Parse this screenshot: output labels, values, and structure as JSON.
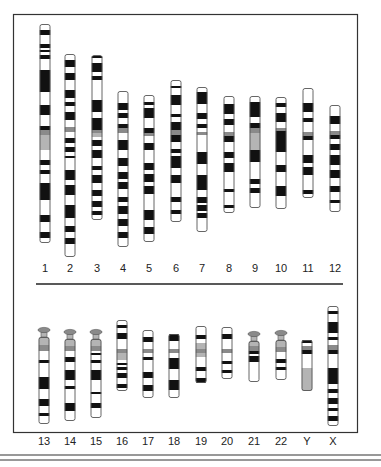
{
  "figure": {
    "type": "karyotype-ideogram",
    "colors": {
      "dark": "#111111",
      "grey": "#8a8a8a",
      "light_grey": "#b4b4b4",
      "outline": "#555555",
      "light": "#ffffff"
    },
    "row1": [
      {
        "label": "1",
        "x": 45,
        "top": 24,
        "bottom": 243,
        "bands": [
          [
            30,
            35,
            "d"
          ],
          [
            44,
            48,
            "d"
          ],
          [
            50,
            52,
            "d"
          ],
          [
            55,
            59,
            "d"
          ],
          [
            70,
            92,
            "d"
          ],
          [
            105,
            115,
            "d"
          ],
          [
            126,
            130,
            "d"
          ],
          [
            130,
            135,
            "g"
          ],
          [
            135,
            150,
            "l"
          ],
          [
            160,
            165,
            "d"
          ],
          [
            170,
            174,
            "d"
          ],
          [
            183,
            200,
            "d"
          ],
          [
            215,
            222,
            "d"
          ],
          [
            232,
            238,
            "d"
          ]
        ]
      },
      {
        "label": "2",
        "x": 70,
        "top": 54,
        "bottom": 257,
        "bands": [
          [
            60,
            67,
            "d"
          ],
          [
            73,
            80,
            "d"
          ],
          [
            90,
            98,
            "d"
          ],
          [
            102,
            106,
            "d"
          ],
          [
            112,
            120,
            "d"
          ],
          [
            127,
            132,
            "g"
          ],
          [
            138,
            143,
            "d"
          ],
          [
            147,
            152,
            "d"
          ],
          [
            156,
            158,
            "d"
          ],
          [
            170,
            180,
            "d"
          ],
          [
            185,
            195,
            "d"
          ],
          [
            205,
            218,
            "d"
          ],
          [
            226,
            232,
            "d"
          ],
          [
            238,
            244,
            "d"
          ]
        ]
      },
      {
        "label": "3",
        "x": 97,
        "top": 55,
        "bottom": 220,
        "bands": [
          [
            56,
            58,
            "d"
          ],
          [
            63,
            72,
            "d"
          ],
          [
            76,
            80,
            "d"
          ],
          [
            100,
            112,
            "d"
          ],
          [
            118,
            130,
            "d"
          ],
          [
            130,
            133,
            "g"
          ],
          [
            133,
            137,
            "l"
          ],
          [
            140,
            146,
            "d"
          ],
          [
            150,
            158,
            "d"
          ],
          [
            166,
            170,
            "d"
          ],
          [
            175,
            183,
            "d"
          ],
          [
            190,
            196,
            "d"
          ],
          [
            201,
            207,
            "d"
          ],
          [
            211,
            215,
            "d"
          ]
        ]
      },
      {
        "label": "4",
        "x": 123,
        "top": 91,
        "bottom": 247,
        "bands": [
          [
            103,
            110,
            "d"
          ],
          [
            113,
            118,
            "d"
          ],
          [
            124,
            128,
            "d"
          ],
          [
            128,
            133,
            "g"
          ],
          [
            140,
            150,
            "d"
          ],
          [
            158,
            166,
            "d"
          ],
          [
            172,
            179,
            "d"
          ],
          [
            182,
            189,
            "d"
          ],
          [
            197,
            202,
            "d"
          ],
          [
            206,
            214,
            "d"
          ],
          [
            219,
            226,
            "d"
          ],
          [
            232,
            238,
            "d"
          ]
        ]
      },
      {
        "label": "5",
        "x": 149,
        "top": 95,
        "bottom": 242,
        "bands": [
          [
            102,
            105,
            "d"
          ],
          [
            108,
            118,
            "d"
          ],
          [
            128,
            133,
            "d"
          ],
          [
            133,
            136,
            "g"
          ],
          [
            143,
            150,
            "d"
          ],
          [
            163,
            170,
            "d"
          ],
          [
            174,
            182,
            "d"
          ],
          [
            186,
            194,
            "d"
          ],
          [
            210,
            220,
            "d"
          ],
          [
            227,
            234,
            "d"
          ]
        ]
      },
      {
        "label": "6",
        "x": 176,
        "top": 80,
        "bottom": 222,
        "bands": [
          [
            86,
            88,
            "d"
          ],
          [
            95,
            105,
            "d"
          ],
          [
            114,
            117,
            "d"
          ],
          [
            122,
            130,
            "d"
          ],
          [
            130,
            135,
            "g"
          ],
          [
            135,
            142,
            "d"
          ],
          [
            149,
            153,
            "d"
          ],
          [
            156,
            168,
            "d"
          ],
          [
            175,
            183,
            "d"
          ],
          [
            197,
            202,
            "d"
          ],
          [
            210,
            214,
            "d"
          ]
        ]
      },
      {
        "label": "7",
        "x": 202,
        "top": 87,
        "bottom": 232,
        "bands": [
          [
            92,
            104,
            "d"
          ],
          [
            113,
            119,
            "d"
          ],
          [
            124,
            128,
            "d"
          ],
          [
            132,
            135,
            "g"
          ],
          [
            152,
            164,
            "d"
          ],
          [
            175,
            190,
            "d"
          ],
          [
            197,
            203,
            "d"
          ],
          [
            205,
            211,
            "d"
          ],
          [
            213,
            218,
            "d"
          ]
        ]
      },
      {
        "label": "8",
        "x": 229,
        "top": 96,
        "bottom": 213,
        "bands": [
          [
            104,
            114,
            "d"
          ],
          [
            119,
            125,
            "d"
          ],
          [
            132,
            136,
            "g"
          ],
          [
            136,
            142,
            "d"
          ],
          [
            152,
            158,
            "d"
          ],
          [
            163,
            172,
            "d"
          ],
          [
            189,
            192,
            "d"
          ],
          [
            205,
            208,
            "d"
          ]
        ]
      },
      {
        "label": "9",
        "x": 255,
        "top": 96,
        "bottom": 208,
        "bands": [
          [
            102,
            117,
            "d"
          ],
          [
            123,
            128,
            "d"
          ],
          [
            128,
            133,
            "g"
          ],
          [
            133,
            150,
            "l"
          ],
          [
            150,
            162,
            "d"
          ],
          [
            179,
            184,
            "d"
          ],
          [
            188,
            193,
            "d"
          ]
        ]
      },
      {
        "label": "10",
        "x": 281,
        "top": 97,
        "bottom": 209,
        "bands": [
          [
            103,
            107,
            "d"
          ],
          [
            113,
            122,
            "d"
          ],
          [
            128,
            131,
            "g"
          ],
          [
            131,
            152,
            "d"
          ],
          [
            165,
            172,
            "d"
          ],
          [
            186,
            196,
            "d"
          ]
        ]
      },
      {
        "label": "11",
        "x": 308,
        "top": 88,
        "bottom": 198,
        "bands": [
          [
            103,
            112,
            "d"
          ],
          [
            118,
            122,
            "d"
          ],
          [
            132,
            136,
            "g"
          ],
          [
            136,
            140,
            "d"
          ],
          [
            155,
            163,
            "d"
          ],
          [
            167,
            175,
            "d"
          ],
          [
            190,
            194,
            "d"
          ]
        ]
      },
      {
        "label": "12",
        "x": 335,
        "top": 105,
        "bottom": 212,
        "bands": [
          [
            116,
            124,
            "d"
          ],
          [
            131,
            135,
            "g"
          ],
          [
            135,
            139,
            "d"
          ],
          [
            144,
            150,
            "d"
          ],
          [
            155,
            165,
            "d"
          ],
          [
            170,
            178,
            "d"
          ],
          [
            186,
            192,
            "d"
          ],
          [
            200,
            203,
            "d"
          ]
        ]
      }
    ],
    "row2": [
      {
        "label": "13",
        "x": 44,
        "top": 337,
        "bottom": 424,
        "satellite": 330,
        "bands": [
          [
            337,
            345,
            "lg"
          ],
          [
            345,
            351,
            "g"
          ],
          [
            360,
            363,
            "d"
          ],
          [
            377,
            389,
            "d"
          ],
          [
            399,
            406,
            "d"
          ],
          [
            413,
            416,
            "d"
          ]
        ]
      },
      {
        "label": "14",
        "x": 70,
        "top": 339,
        "bottom": 421,
        "satellite": 332,
        "bands": [
          [
            339,
            346,
            "lg"
          ],
          [
            346,
            351,
            "g"
          ],
          [
            357,
            362,
            "d"
          ],
          [
            370,
            380,
            "d"
          ],
          [
            386,
            389,
            "d"
          ],
          [
            403,
            411,
            "d"
          ]
        ]
      },
      {
        "label": "15",
        "x": 96,
        "top": 339,
        "bottom": 418,
        "satellite": 332,
        "bands": [
          [
            339,
            346,
            "lg"
          ],
          [
            346,
            351,
            "g"
          ],
          [
            353,
            355,
            "d"
          ],
          [
            360,
            363,
            "d"
          ],
          [
            370,
            380,
            "d"
          ],
          [
            392,
            394,
            "d"
          ],
          [
            403,
            408,
            "d"
          ]
        ]
      },
      {
        "label": "16",
        "x": 122,
        "top": 320,
        "bottom": 391,
        "bands": [
          [
            325,
            328,
            "d"
          ],
          [
            333,
            339,
            "d"
          ],
          [
            349,
            353,
            "g"
          ],
          [
            353,
            360,
            "lg"
          ],
          [
            363,
            365,
            "d"
          ],
          [
            367,
            370,
            "d"
          ],
          [
            373,
            378,
            "d"
          ],
          [
            384,
            388,
            "d"
          ]
        ]
      },
      {
        "label": "17",
        "x": 148,
        "top": 330,
        "bottom": 398,
        "bands": [
          [
            337,
            342,
            "d"
          ],
          [
            349,
            353,
            "g"
          ],
          [
            357,
            360,
            "d"
          ],
          [
            372,
            378,
            "d"
          ],
          [
            385,
            391,
            "d"
          ]
        ]
      },
      {
        "label": "18",
        "x": 174,
        "top": 334,
        "bottom": 398,
        "bands": [
          [
            334,
            341,
            "d"
          ],
          [
            349,
            353,
            "g"
          ],
          [
            358,
            369,
            "d"
          ],
          [
            380,
            390,
            "d"
          ]
        ]
      },
      {
        "label": "19",
        "x": 201,
        "top": 326,
        "bottom": 383,
        "bands": [
          [
            335,
            339,
            "d"
          ],
          [
            343,
            349,
            "lg"
          ],
          [
            349,
            353,
            "g"
          ],
          [
            353,
            357,
            "lg"
          ],
          [
            367,
            371,
            "d"
          ],
          [
            378,
            383,
            "d"
          ]
        ]
      },
      {
        "label": "20",
        "x": 227,
        "top": 327,
        "bottom": 379,
        "bands": [
          [
            334,
            339,
            "d"
          ],
          [
            349,
            353,
            "g"
          ],
          [
            361,
            364,
            "d"
          ],
          [
            370,
            373,
            "d"
          ]
        ]
      },
      {
        "label": "21",
        "x": 254,
        "top": 341,
        "bottom": 382,
        "satellite": 334,
        "bands": [
          [
            341,
            346,
            "lg"
          ],
          [
            346,
            351,
            "g"
          ],
          [
            351,
            354,
            "d"
          ],
          [
            356,
            362,
            "d"
          ]
        ]
      },
      {
        "label": "22",
        "x": 281,
        "top": 340,
        "bottom": 380,
        "satellite": 333,
        "bands": [
          [
            340,
            347,
            "lg"
          ],
          [
            347,
            352,
            "g"
          ],
          [
            359,
            363,
            "d"
          ],
          [
            367,
            370,
            "d"
          ]
        ]
      },
      {
        "label": "Y",
        "x": 307,
        "top": 340,
        "bottom": 391,
        "bands": [
          [
            340,
            343,
            "d"
          ],
          [
            346,
            350,
            "g"
          ],
          [
            350,
            354,
            "d"
          ],
          [
            368,
            391,
            "lg"
          ]
        ]
      },
      {
        "label": "X",
        "x": 333,
        "top": 306,
        "bottom": 426,
        "bands": [
          [
            311,
            314,
            "d"
          ],
          [
            322,
            333,
            "d"
          ],
          [
            337,
            340,
            "d"
          ],
          [
            345,
            350,
            "g"
          ],
          [
            350,
            354,
            "d"
          ],
          [
            368,
            384,
            "d"
          ],
          [
            389,
            393,
            "d"
          ],
          [
            398,
            404,
            "d"
          ],
          [
            408,
            411,
            "d"
          ],
          [
            416,
            421,
            "d"
          ]
        ]
      }
    ]
  }
}
